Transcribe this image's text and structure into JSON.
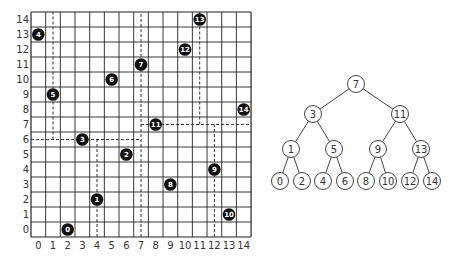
{
  "colors": {
    "grid": "#222222",
    "dash": "#333333",
    "point_fill": "#111111",
    "point_text": "#ffffff",
    "node_stroke": "#444444",
    "node_fill": "#ffffff",
    "label": "#333333"
  },
  "grid": {
    "left": 31,
    "top": 12,
    "cell_w": 14.67,
    "cell_h": 15,
    "cols": 15,
    "rows": 15,
    "x_ticks": [
      "0",
      "1",
      "2",
      "3",
      "4",
      "5",
      "6",
      "7",
      "8",
      "9",
      "10",
      "11",
      "12",
      "13",
      "14"
    ],
    "y_ticks": [
      "0",
      "1",
      "2",
      "3",
      "4",
      "5",
      "6",
      "7",
      "8",
      "9",
      "10",
      "11",
      "12",
      "13",
      "14"
    ]
  },
  "points": [
    {
      "label": "0",
      "x": 2,
      "y": 0
    },
    {
      "label": "1",
      "x": 4,
      "y": 2
    },
    {
      "label": "2",
      "x": 6,
      "y": 5
    },
    {
      "label": "3",
      "x": 3,
      "y": 6
    },
    {
      "label": "4",
      "x": 0,
      "y": 13
    },
    {
      "label": "5",
      "x": 1,
      "y": 9
    },
    {
      "label": "6",
      "x": 5,
      "y": 10
    },
    {
      "label": "7",
      "x": 7,
      "y": 11
    },
    {
      "label": "8",
      "x": 9,
      "y": 3
    },
    {
      "label": "9",
      "x": 12,
      "y": 4
    },
    {
      "label": "10",
      "x": 13,
      "y": 1
    },
    {
      "label": "11",
      "x": 8,
      "y": 7
    },
    {
      "label": "12",
      "x": 10,
      "y": 12
    },
    {
      "label": "13",
      "x": 11,
      "y": 14
    },
    {
      "label": "14",
      "x": 14,
      "y": 8
    }
  ],
  "splits": [
    {
      "type": "v",
      "at": 7,
      "from": -0.5,
      "to": 14.5
    },
    {
      "type": "h",
      "at": 6,
      "from": -0.5,
      "to": 7
    },
    {
      "type": "v",
      "at": 1,
      "from": 6,
      "to": 14.5
    },
    {
      "type": "v",
      "at": 4,
      "from": -0.5,
      "to": 6
    },
    {
      "type": "h",
      "at": 7,
      "from": 7,
      "to": 14.5
    },
    {
      "type": "v",
      "at": 11,
      "from": 7,
      "to": 14.5
    },
    {
      "type": "v",
      "at": 12,
      "from": -0.5,
      "to": 7
    }
  ],
  "tree": {
    "radius": 8.5,
    "nodes": [
      {
        "id": "7",
        "x": 356,
        "y": 84
      },
      {
        "id": "3",
        "x": 313,
        "y": 114
      },
      {
        "id": "11",
        "x": 400,
        "y": 114
      },
      {
        "id": "1",
        "x": 291,
        "y": 149
      },
      {
        "id": "5",
        "x": 334,
        "y": 149
      },
      {
        "id": "9",
        "x": 378,
        "y": 149
      },
      {
        "id": "13",
        "x": 421,
        "y": 149
      },
      {
        "id": "0",
        "x": 280,
        "y": 181
      },
      {
        "id": "2",
        "x": 302,
        "y": 181
      },
      {
        "id": "4",
        "x": 323,
        "y": 181
      },
      {
        "id": "6",
        "x": 345,
        "y": 181
      },
      {
        "id": "8",
        "x": 366,
        "y": 181
      },
      {
        "id": "10",
        "x": 388,
        "y": 181
      },
      {
        "id": "12",
        "x": 410,
        "y": 181
      },
      {
        "id": "14",
        "x": 432,
        "y": 181
      }
    ],
    "edges": [
      [
        "7",
        "3"
      ],
      [
        "7",
        "11"
      ],
      [
        "3",
        "1"
      ],
      [
        "3",
        "5"
      ],
      [
        "11",
        "9"
      ],
      [
        "11",
        "13"
      ],
      [
        "1",
        "0"
      ],
      [
        "1",
        "2"
      ],
      [
        "5",
        "4"
      ],
      [
        "5",
        "6"
      ],
      [
        "9",
        "8"
      ],
      [
        "9",
        "10"
      ],
      [
        "13",
        "12"
      ],
      [
        "13",
        "14"
      ]
    ]
  }
}
